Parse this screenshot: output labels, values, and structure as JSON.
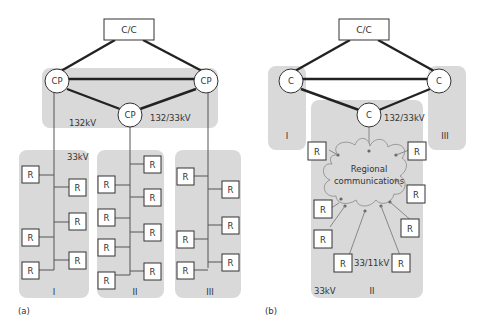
{
  "figure_a": {
    "label": "(a)",
    "control_centre": "C/C",
    "control_points": [
      "CP",
      "CP",
      "CP"
    ],
    "voltage_labels": {
      "transmission": "132kV",
      "substation": "132/33kV",
      "distribution": "33kV"
    },
    "regions": [
      {
        "label": "I",
        "rtus": [
          "R",
          "R",
          "R",
          "R",
          "R",
          "R"
        ]
      },
      {
        "label": "II",
        "rtus": [
          "R",
          "R",
          "R",
          "R",
          "R",
          "R",
          "R",
          "R"
        ]
      },
      {
        "label": "III",
        "rtus": [
          "R",
          "R",
          "R",
          "R",
          "R",
          "R"
        ]
      }
    ],
    "rtu_label": "R"
  },
  "figure_b": {
    "label": "(b)",
    "control_centre": "C/C",
    "control_points": [
      "C",
      "C",
      "C"
    ],
    "voltage_labels": {
      "substation": "132/33kV",
      "distribution": "33kV",
      "secondary": "33/11kV"
    },
    "cloud_label_1": "Regional",
    "cloud_label_2": "communications",
    "regions": [
      {
        "label": "I"
      },
      {
        "label": "II",
        "rtus": [
          "R",
          "R",
          "R",
          "R",
          "R",
          "R",
          "R",
          "R"
        ]
      },
      {
        "label": "III"
      }
    ],
    "rtu_label": "R"
  }
}
